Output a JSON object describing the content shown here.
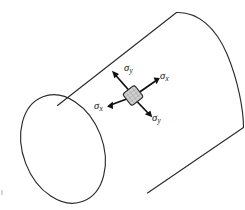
{
  "figure": {
    "background_color": "#ffffff",
    "line_color": "#2b2b2b",
    "arrow_color": "#111111",
    "element_fill": "#cfcfcf",
    "width": 245,
    "height": 210
  },
  "shape": {
    "name": "cylinder",
    "orientation": "diagonal-axis-lower-left-to-upper-right",
    "near_end_face": "full-ellipse",
    "far_end_face": "partial-arc"
  },
  "stress_element": {
    "name": "surface-stress-element",
    "shape": "rounded-square",
    "center_x": 133,
    "center_y": 95,
    "rotation_deg": -38
  },
  "labels": {
    "sigma_y_top": {
      "symbol": "σ",
      "subscript": "y"
    },
    "sigma_x_right": {
      "symbol": "σ",
      "subscript": "x"
    },
    "sigma_x_left": {
      "symbol": "σ",
      "subscript": "x"
    },
    "sigma_y_bottom": {
      "symbol": "σ",
      "subscript": "y"
    }
  },
  "arrows": [
    {
      "name": "sigma-y-upper-left-arrow",
      "direction": "up-left",
      "label": "σy"
    },
    {
      "name": "sigma-x-upper-right-arrow",
      "direction": "up-right",
      "label": "σx"
    },
    {
      "name": "sigma-x-lower-left-arrow",
      "direction": "down-left",
      "label": "σx"
    },
    {
      "name": "sigma-y-lower-right-arrow",
      "direction": "down-right",
      "label": "σy"
    }
  ]
}
